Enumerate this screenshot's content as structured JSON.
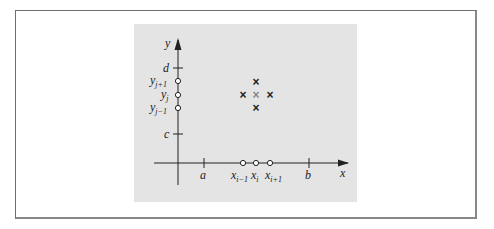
{
  "figure": {
    "axes": {
      "x_label": "x",
      "y_label": "y"
    },
    "x_ticks": [
      {
        "label": "a",
        "sub": ""
      },
      {
        "label": "b",
        "sub": ""
      }
    ],
    "x_nodes": [
      {
        "label": "x",
        "sub": "i−1"
      },
      {
        "label": "x",
        "sub": "i"
      },
      {
        "label": "x",
        "sub": "i+1"
      }
    ],
    "y_ticks": [
      {
        "label": "d",
        "sub": ""
      },
      {
        "label": "c",
        "sub": ""
      }
    ],
    "y_nodes": [
      {
        "label": "y",
        "sub": "j+1"
      },
      {
        "label": "y",
        "sub": "j"
      },
      {
        "label": "y",
        "sub": "j−1"
      }
    ],
    "stencil_marker": "×",
    "colors": {
      "panel": "#e4e4e4",
      "ink": "#222222",
      "center_marker": "#888888",
      "frame": "#6e6e6e"
    }
  }
}
